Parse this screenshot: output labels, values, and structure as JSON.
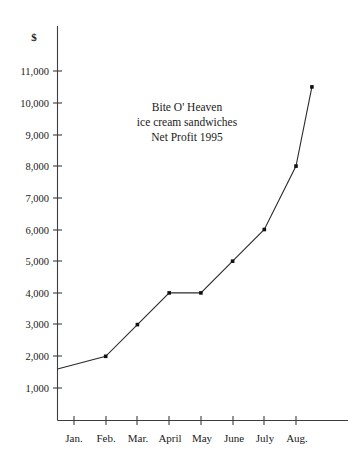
{
  "chart_data": {
    "type": "line",
    "title_lines": [
      "Bite O' Heaven",
      "ice cream sandwiches",
      "Net Profit 1995"
    ],
    "xlabel": "",
    "ylabel": "$",
    "categories": [
      "Jan.",
      "Feb.",
      "Mar.",
      "April",
      "May",
      "June",
      "July",
      "Aug."
    ],
    "values": [
      1600,
      2000,
      3000,
      4000,
      4000,
      5000,
      6000,
      8000
    ],
    "extra_points": [
      {
        "label": "",
        "value": 10500
      }
    ],
    "series": [
      {
        "name": "Net Profit 1995",
        "points": [
          {
            "x_label": "start",
            "value": 1600
          },
          {
            "x_label": "Feb.",
            "value": 2000
          },
          {
            "x_label": "Mar.",
            "value": 3000
          },
          {
            "x_label": "April",
            "value": 4000
          },
          {
            "x_label": "May",
            "value": 4000
          },
          {
            "x_label": "June",
            "value": 5000
          },
          {
            "x_label": "July",
            "value": 6000
          },
          {
            "x_label": "Aug.",
            "value": 8000
          },
          {
            "x_label": "",
            "value": 10500
          }
        ]
      }
    ],
    "ytick_labels": [
      "11,000",
      "10,000",
      "9,000",
      "8,000",
      "7,000",
      "6,000",
      "5,000",
      "4,000",
      "3,000",
      "2,000",
      "1,000"
    ],
    "ytick_values": [
      11000,
      10000,
      9000,
      8000,
      7000,
      6000,
      5000,
      4000,
      3000,
      2000,
      1000
    ],
    "ylim": [
      0,
      11600
    ],
    "grid": false,
    "legend": "none",
    "line_color": "#2b2b2b",
    "marker_color": "#111111",
    "axis_color": "#3d3d3d",
    "background": "#ffffff"
  },
  "axis": {
    "currency_symbol": "$",
    "y_labels": {
      "t11000": "11,000",
      "t10000": "10,000",
      "t9000": "9,000",
      "t8000": "8,000",
      "t7000": "7,000",
      "t6000": "6,000",
      "t5000": "5,000",
      "t4000": "4,000",
      "t3000": "3,000",
      "t2000": "2,000",
      "t1000": "1,000"
    },
    "x_labels": {
      "m1": "Jan.",
      "m2": "Feb.",
      "m3": "Mar.",
      "m4": "April",
      "m5": "May",
      "m6": "June",
      "m7": "July",
      "m8": "Aug."
    }
  },
  "annotation": {
    "line1": "Bite O' Heaven",
    "line2": "ice cream sandwiches",
    "line3": "Net Profit 1995"
  }
}
